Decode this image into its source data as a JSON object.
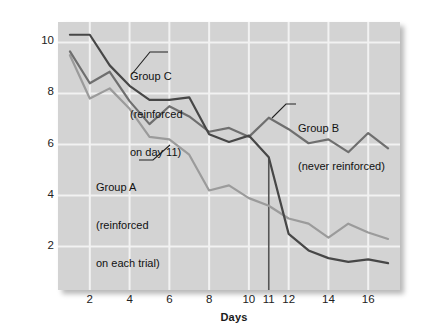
{
  "chart": {
    "type": "line",
    "title": "",
    "xlabel": "Days",
    "ylabel": "Mean number of errors",
    "xlim": [
      0.4,
      17.6
    ],
    "ylim": [
      0.3,
      10.8
    ],
    "x_ticks": [
      2,
      4,
      6,
      8,
      10,
      11,
      12,
      14,
      16
    ],
    "x_tick_labels": [
      "2",
      "4",
      "6",
      "8",
      "10",
      "11",
      "12",
      "14",
      "16"
    ],
    "y_ticks": [
      2,
      4,
      6,
      8,
      10
    ],
    "y_tick_labels": [
      "2",
      "4",
      "6",
      "8",
      "10"
    ],
    "grid": "both",
    "grid_color": "#f2f2f2",
    "plot_background": "#d3d3d3",
    "legend_position": "inline-annotations",
    "marker_line_day": 11
  },
  "chart_data": {
    "type": "line",
    "title": "",
    "xlabel": "Days",
    "ylabel": "Mean number of errors",
    "xlim": [
      0.4,
      17.6
    ],
    "ylim": [
      0.3,
      10.8
    ],
    "x": [
      1,
      2,
      3,
      4,
      5,
      6,
      7,
      8,
      9,
      10,
      11,
      12,
      13,
      14,
      15,
      16,
      17
    ],
    "grid": true,
    "series": [
      {
        "name": "Group A",
        "label": "Group A (reinforced on each trial)",
        "color": "#9b9b9b",
        "values": [
          9.5,
          7.8,
          8.2,
          7.4,
          6.3,
          6.2,
          5.6,
          4.2,
          4.4,
          3.9,
          3.6,
          3.1,
          2.9,
          2.35,
          2.9,
          2.55,
          2.3
        ]
      },
      {
        "name": "Group B",
        "label": "Group B (never reinforced)",
        "color": "#6f6f6f",
        "values": [
          9.65,
          8.4,
          8.85,
          7.7,
          6.8,
          7.5,
          7.1,
          6.5,
          6.65,
          6.3,
          7.05,
          6.6,
          6.05,
          6.2,
          5.7,
          6.45,
          5.85
        ]
      },
      {
        "name": "Group C",
        "label": "Group C (reinforced on day 11)",
        "color": "#474747",
        "values": [
          10.3,
          10.3,
          9.1,
          8.3,
          7.75,
          7.75,
          7.85,
          6.4,
          6.1,
          6.35,
          5.5,
          2.5,
          1.85,
          1.55,
          1.4,
          1.5,
          1.35
        ]
      }
    ],
    "annotations": [
      {
        "name": "group-c-annotation",
        "text": "Group C\n(reinforced\non day 11)",
        "series": "Group C"
      },
      {
        "name": "group-b-annotation",
        "text": "Group B\n(never reinforced)",
        "series": "Group B"
      },
      {
        "name": "group-a-annotation",
        "text": "Group A\n(reinforced\non each trial)",
        "series": "Group A"
      }
    ],
    "vertical_marker": {
      "x": 11,
      "color": "#555555",
      "label": "day 11 reinforcement"
    }
  },
  "annotations": {
    "group_c_line1": "Group C",
    "group_c_line2": "(reinforced",
    "group_c_line3": "on day 11)",
    "group_b_line1": "Group B",
    "group_b_line2": "(never reinforced)",
    "group_a_line1": "Group A",
    "group_a_line2": "(reinforced",
    "group_a_line3": "on each trial)"
  }
}
